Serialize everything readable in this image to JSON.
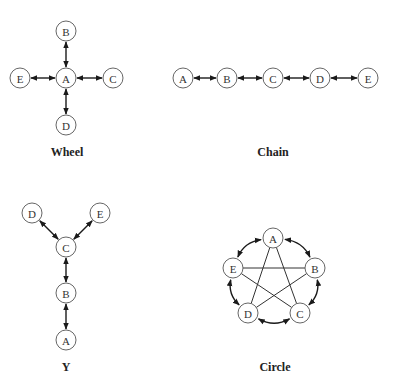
{
  "diagram": {
    "node_radius": 10,
    "colors": {
      "node_stroke": "#555555",
      "edge": "#1a1a1a",
      "text": "#333333",
      "caption": "#222222",
      "background": "#ffffff"
    },
    "networks": [
      {
        "id": "wheel",
        "caption": "Wheel",
        "caption_pos": [
          67,
          152
        ],
        "nodes": [
          {
            "id": "A",
            "label": "A",
            "x": 66,
            "y": 78
          },
          {
            "id": "B",
            "label": "B",
            "x": 66,
            "y": 31
          },
          {
            "id": "C",
            "label": "C",
            "x": 113,
            "y": 78
          },
          {
            "id": "D",
            "label": "D",
            "x": 66,
            "y": 125
          },
          {
            "id": "E",
            "label": "E",
            "x": 20,
            "y": 78
          }
        ],
        "edges": [
          {
            "from": "A",
            "to": "B",
            "type": "bidirectional"
          },
          {
            "from": "A",
            "to": "C",
            "type": "bidirectional"
          },
          {
            "from": "A",
            "to": "D",
            "type": "bidirectional"
          },
          {
            "from": "A",
            "to": "E",
            "type": "bidirectional"
          }
        ]
      },
      {
        "id": "chain",
        "caption": "Chain",
        "caption_pos": [
          273,
          152
        ],
        "nodes": [
          {
            "id": "A",
            "label": "A",
            "x": 183,
            "y": 78
          },
          {
            "id": "B",
            "label": "B",
            "x": 227,
            "y": 78
          },
          {
            "id": "C",
            "label": "C",
            "x": 273,
            "y": 78
          },
          {
            "id": "D",
            "label": "D",
            "x": 320,
            "y": 78
          },
          {
            "id": "E",
            "label": "E",
            "x": 368,
            "y": 78
          }
        ],
        "edges": [
          {
            "from": "A",
            "to": "B",
            "type": "bidirectional"
          },
          {
            "from": "B",
            "to": "C",
            "type": "bidirectional"
          },
          {
            "from": "C",
            "to": "D",
            "type": "bidirectional"
          },
          {
            "from": "D",
            "to": "E",
            "type": "bidirectional"
          }
        ]
      },
      {
        "id": "y",
        "caption": "Y",
        "caption_pos": [
          66,
          367
        ],
        "nodes": [
          {
            "id": "A",
            "label": "A",
            "x": 66,
            "y": 340
          },
          {
            "id": "B",
            "label": "B",
            "x": 66,
            "y": 293
          },
          {
            "id": "C",
            "label": "C",
            "x": 66,
            "y": 247
          },
          {
            "id": "D",
            "label": "D",
            "x": 32,
            "y": 213
          },
          {
            "id": "E",
            "label": "E",
            "x": 100,
            "y": 213
          }
        ],
        "edges": [
          {
            "from": "C",
            "to": "D",
            "type": "bidirectional"
          },
          {
            "from": "C",
            "to": "E",
            "type": "bidirectional"
          },
          {
            "from": "C",
            "to": "B",
            "type": "bidirectional"
          },
          {
            "from": "B",
            "to": "A",
            "type": "bidirectional"
          }
        ]
      },
      {
        "id": "circle",
        "caption": "Circle",
        "caption_pos": [
          275,
          367
        ],
        "nodes": [
          {
            "id": "A",
            "label": "A",
            "x": 273,
            "y": 238
          },
          {
            "id": "B",
            "label": "B",
            "x": 315,
            "y": 268
          },
          {
            "id": "C",
            "label": "C",
            "x": 300,
            "y": 313
          },
          {
            "id": "D",
            "label": "D",
            "x": 248,
            "y": 313
          },
          {
            "id": "E",
            "label": "E",
            "x": 233,
            "y": 268
          }
        ],
        "edges": [
          {
            "from": "A",
            "to": "B",
            "type": "bidirectional-curved"
          },
          {
            "from": "B",
            "to": "C",
            "type": "bidirectional-curved"
          },
          {
            "from": "C",
            "to": "D",
            "type": "bidirectional-curved"
          },
          {
            "from": "D",
            "to": "E",
            "type": "bidirectional-curved"
          },
          {
            "from": "E",
            "to": "A",
            "type": "bidirectional-curved"
          },
          {
            "from": "A",
            "to": "C",
            "type": "plain"
          },
          {
            "from": "A",
            "to": "D",
            "type": "plain"
          },
          {
            "from": "B",
            "to": "D",
            "type": "plain"
          },
          {
            "from": "B",
            "to": "E",
            "type": "plain"
          },
          {
            "from": "C",
            "to": "E",
            "type": "plain"
          }
        ]
      }
    ]
  }
}
